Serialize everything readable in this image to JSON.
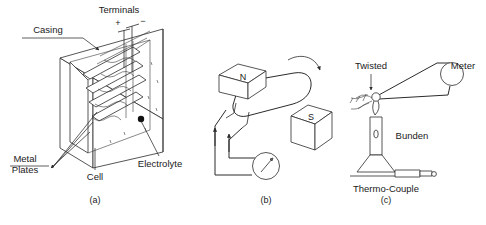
{
  "figure": {
    "background": "#ffffff",
    "ink": "#2b2b2b"
  },
  "panels": [
    {
      "id": "a",
      "caption": "(a)",
      "name": "simple-cell-diagram",
      "labels": {
        "terminals": "Terminals",
        "terminal_positive": "+",
        "terminal_negative": "−",
        "casing": "Casing",
        "metal_plates_line1": "Metal",
        "metal_plates_line2": "Plates",
        "cell": "Cell",
        "electrolyte": "Electrolyte"
      }
    },
    {
      "id": "b",
      "caption": "(b)",
      "name": "generator-diagram",
      "labels": {
        "north_pole": "N",
        "south_pole": "S"
      }
    },
    {
      "id": "c",
      "caption": "(c)",
      "name": "thermocouple-diagram",
      "labels": {
        "twisted": "Twisted",
        "meter": "Meter",
        "bunsen": "Bunden",
        "thermocouple": "Thermo-Couple"
      }
    }
  ]
}
